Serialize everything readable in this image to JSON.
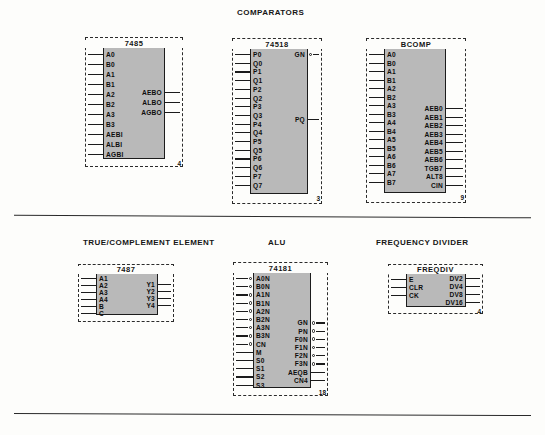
{
  "page": {
    "sections": [
      {
        "id": "comparators",
        "title": "COMPARATORS"
      },
      {
        "id": "true-complement",
        "title": "TRUE/COMPLEMENT ELEMENT"
      },
      {
        "id": "alu",
        "title": "ALU"
      },
      {
        "id": "frequency-divider",
        "title": "FREQUENCY DIVIDER"
      }
    ]
  },
  "blocks": {
    "comp7485": {
      "part_number": "7485",
      "corner_number": "4",
      "inputs": [
        "A0",
        "B0",
        "A1",
        "B1",
        "A2",
        "B2",
        "A3",
        "B3",
        "AEBI",
        "ALBI",
        "AGBI"
      ],
      "outputs": [
        "AEBO",
        "ALBO",
        "AGBO"
      ],
      "inverted_inputs": [],
      "inverted_outputs": []
    },
    "comp74518": {
      "part_number": "74518",
      "corner_number": "3",
      "inputs": [
        "P0",
        "Q0",
        "P1",
        "Q1",
        "P2",
        "Q2",
        "P3",
        "Q3",
        "P4",
        "Q4",
        "P5",
        "Q5",
        "P6",
        "Q6",
        "P7",
        "Q7"
      ],
      "outputs": [
        "GN",
        "PQ"
      ],
      "inverted_inputs": [],
      "inverted_outputs": [
        "GN"
      ]
    },
    "bcomp": {
      "part_number": "BCOMP",
      "corner_number": "9",
      "inputs": [
        "A0",
        "B0",
        "A1",
        "B1",
        "A2",
        "B2",
        "A3",
        "B3",
        "A4",
        "B4",
        "A5",
        "B5",
        "A6",
        "B6",
        "A7",
        "B7"
      ],
      "outputs": [
        "AEB0",
        "AEB1",
        "AEB2",
        "AEB3",
        "AEB4",
        "AEB5",
        "AEB6",
        "TGB7",
        "ALT8",
        "CIN"
      ],
      "inverted_inputs": [],
      "inverted_outputs": []
    },
    "tc7487": {
      "part_number": "7487",
      "corner_number": "",
      "inputs": [
        "A1",
        "A2",
        "A3",
        "A4",
        "B",
        "C"
      ],
      "outputs": [
        "Y1",
        "Y2",
        "Y3",
        "Y4"
      ],
      "inverted_inputs": [],
      "inverted_outputs": []
    },
    "alu74181": {
      "part_number": "74181",
      "corner_number": "18",
      "inputs": [
        "A0N",
        "B0N",
        "A1N",
        "B1N",
        "A2N",
        "B2N",
        "A3N",
        "B3N",
        "CN",
        "M",
        "S0",
        "S1",
        "S2",
        "S3"
      ],
      "outputs": [
        "GN",
        "PN",
        "F0N",
        "F1N",
        "F2N",
        "F3N",
        "AEQB",
        "CN4"
      ],
      "inverted_inputs": [
        "A0N",
        "B0N",
        "A1N",
        "B1N",
        "A2N",
        "B2N",
        "A3N",
        "B3N",
        "CN"
      ],
      "inverted_outputs": [
        "GN",
        "PN",
        "F0N",
        "F1N",
        "F2N",
        "F3N"
      ]
    },
    "freqdiv": {
      "part_number": "FREQDIV",
      "corner_number": "4",
      "inputs": [
        "E",
        "CLR",
        "CK"
      ],
      "outputs": [
        "DV2",
        "DV4",
        "DV8",
        "DV16"
      ],
      "inverted_inputs": [],
      "inverted_outputs": []
    }
  },
  "colors": {
    "block_fill": "#b9b9b9",
    "outline": "#1c1c1c",
    "paper": "#fdfdfb"
  }
}
